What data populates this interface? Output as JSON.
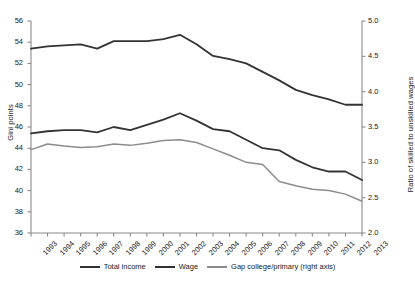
{
  "chart_data": {
    "type": "line",
    "title": "",
    "xlabel": "",
    "ylabel": "Gini points",
    "y2label": "Ratio of skilled to unskilled wages",
    "grid": false,
    "legend_position": "bottom",
    "ylim": [
      36,
      56
    ],
    "y2lim": [
      2.0,
      5.0
    ],
    "yticks": [
      36,
      38,
      40,
      42,
      44,
      46,
      48,
      50,
      52,
      54,
      56
    ],
    "y2ticks": [
      "2.0",
      "2.5",
      "3.0",
      "3.5",
      "4.0",
      "4.5",
      "5.0"
    ],
    "x": [
      "1993",
      "1994",
      "1995",
      "1996",
      "1997",
      "1998",
      "1999",
      "2000",
      "2001",
      "2002",
      "2003",
      "2004",
      "2005",
      "2006",
      "2007",
      "2008",
      "2009",
      "2010",
      "2011",
      "2012",
      "2013"
    ],
    "series": [
      {
        "name": "Total income",
        "axis": "left",
        "color": "#333333",
        "values": [
          53.4,
          53.6,
          53.7,
          53.8,
          53.4,
          54.1,
          54.1,
          54.1,
          54.3,
          54.7,
          53.8,
          52.7,
          52.4,
          52.0,
          51.2,
          50.4,
          49.5,
          49.0,
          48.6,
          48.1,
          48.1
        ]
      },
      {
        "name": "Wage",
        "axis": "left",
        "color": "#333333",
        "values": [
          45.4,
          45.6,
          45.7,
          45.7,
          45.5,
          46.0,
          45.7,
          46.2,
          46.7,
          47.3,
          46.6,
          45.8,
          45.6,
          44.8,
          44.0,
          43.8,
          42.9,
          42.2,
          41.8,
          41.8,
          41.0
        ]
      },
      {
        "name": "Gap college/primary (right axis)",
        "axis": "right",
        "color": "#8c8c8c",
        "values": [
          3.18,
          3.26,
          3.23,
          3.21,
          3.22,
          3.26,
          3.24,
          3.27,
          3.31,
          3.32,
          3.28,
          3.19,
          3.1,
          3.0,
          2.97,
          2.73,
          2.67,
          2.62,
          2.6,
          2.55,
          2.45
        ]
      }
    ]
  },
  "legend": {
    "items": [
      {
        "label": "Total income",
        "color": "#333333"
      },
      {
        "label": "Wage",
        "color": "#333333"
      },
      {
        "label": "Gap college/primary (right axis)",
        "color": "#8c8c8c"
      }
    ]
  }
}
